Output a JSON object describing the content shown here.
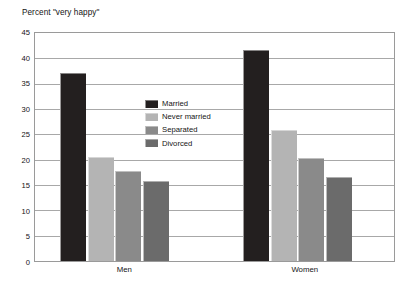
{
  "chart_data": {
    "type": "bar",
    "title": "Percent \"very happy\"",
    "xlabel": "",
    "ylabel": "",
    "ylim": [
      0,
      45
    ],
    "ytick_step": 5,
    "yticks": [
      "45",
      "40",
      "35",
      "30",
      "25",
      "20",
      "15",
      "10",
      "5",
      "0"
    ],
    "grid": true,
    "legend_position": "inside-upper-left",
    "categories": [
      "Men",
      "Women"
    ],
    "series": [
      {
        "name": "Married",
        "color": "#231f1f",
        "values": [
          37.2,
          41.7
        ]
      },
      {
        "name": "Never married",
        "color": "#b4b4b4",
        "values": [
          20.5,
          25.8
        ]
      },
      {
        "name": "Separated",
        "color": "#8a8a8a",
        "values": [
          17.7,
          20.3
        ]
      },
      {
        "name": "Divorced",
        "color": "#6b6b6b",
        "values": [
          15.8,
          16.5
        ]
      }
    ]
  },
  "colors": {
    "frame": "#9a9a9a",
    "gridline": "#a8a8a8",
    "text": "#141414",
    "background": "#ffffff"
  }
}
